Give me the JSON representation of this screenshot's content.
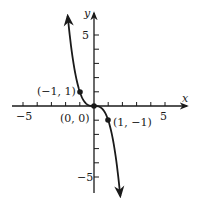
{
  "chart_data": {
    "type": "line",
    "title": "",
    "function": "y = -x^3",
    "xlabel": "x",
    "ylabel": "y",
    "xlim": [
      -5.5,
      6.5
    ],
    "ylim": [
      -6,
      6.5
    ],
    "grid": false,
    "x_ticks": [
      -5,
      -4,
      -3,
      -2,
      -1,
      1,
      2,
      3,
      4,
      5
    ],
    "y_ticks": [
      -5,
      -4,
      -3,
      -2,
      -1,
      1,
      2,
      3,
      4,
      5
    ],
    "x_tick_labels": [
      {
        "value": -5,
        "text": "−5"
      },
      {
        "value": 5,
        "text": "5"
      }
    ],
    "y_tick_labels": [
      {
        "value": 5,
        "text": "5"
      },
      {
        "value": -5,
        "text": "−5"
      }
    ],
    "points": [
      {
        "x": -1,
        "y": 1,
        "label": "(−1, 1)"
      },
      {
        "x": 0,
        "y": 0,
        "label": "(0, 0)"
      },
      {
        "x": 1,
        "y": -1,
        "label": "(1, −1)"
      }
    ],
    "curve": {
      "x_range": [
        -1.85,
        1.85
      ],
      "arrows": "both ends",
      "color": "#1a1a1a"
    }
  },
  "layout": {
    "origin_px": [
      94,
      106
    ],
    "unit_px": 14.2
  }
}
